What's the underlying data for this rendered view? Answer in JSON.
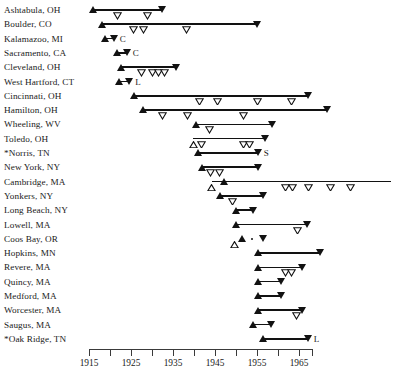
{
  "chart_data": {
    "type": "line",
    "title": "",
    "xlabel": "",
    "ylabel": "",
    "xlim": [
      1915,
      1968
    ],
    "xticks": [
      1915,
      1920,
      1925,
      1930,
      1935,
      1940,
      1945,
      1950,
      1955,
      1960,
      1965
    ],
    "xtick_labels": [
      "1915",
      "",
      "1925",
      "",
      "1935",
      "",
      "1945",
      "",
      "1955",
      "",
      "1965"
    ],
    "grid": false,
    "legend": "none",
    "marker_key": {
      "filled-up-triangle": "start event",
      "open-down-triangle": "intermediate event",
      "filled-down-triangle": "end event",
      "open-up-triangle": "early open start event",
      "dot": "point event"
    },
    "categories": [
      "Ashtabula, OH",
      "Boulder, CO",
      "Kalamazoo, MI",
      "Sacramento, CA",
      "Cleveland, OH",
      "West Hartford, CT",
      "Cincinnati, OH",
      "Hamilton, OH",
      "Wheeling, WV",
      "Toledo, OH",
      "*Norris, TN",
      "New York, NY",
      "Cambridge, MA",
      "Yonkers, NY",
      "Long Beach, NY",
      "Lowell, MA",
      "Coos Bay, OR",
      "Hopkins, MN",
      "Revere, MA",
      "Quincy, MA",
      "Medford, MA",
      "Worcester, MA",
      "Saugus, MA",
      "*Oak Ridge, TN"
    ],
    "rows": [
      {
        "label": "Ashtabula, OH",
        "note": "",
        "line": [
          1916.0,
          1932.5
        ],
        "markers": [
          {
            "x": 1916.0,
            "type": "filled-up-triangle"
          },
          {
            "x": 1921.9,
            "type": "open-down-triangle"
          },
          {
            "x": 1929.0,
            "type": "open-down-triangle"
          },
          {
            "x": 1932.5,
            "type": "filled-down-triangle"
          }
        ]
      },
      {
        "label": "Boulder, CO",
        "note": "",
        "line": [
          1918.2,
          1955.0
        ],
        "markers": [
          {
            "x": 1918.2,
            "type": "filled-up-triangle"
          },
          {
            "x": 1925.5,
            "type": "open-down-triangle"
          },
          {
            "x": 1927.9,
            "type": "open-down-triangle"
          },
          {
            "x": 1938.1,
            "type": "open-down-triangle"
          },
          {
            "x": 1955.0,
            "type": "filled-down-triangle"
          }
        ]
      },
      {
        "label": "Kalamazoo, MI",
        "note": "C",
        "line": [
          1918.8,
          1920.9
        ],
        "markers": [
          {
            "x": 1918.8,
            "type": "filled-up-triangle"
          },
          {
            "x": 1920.9,
            "type": "filled-down-triangle"
          }
        ]
      },
      {
        "label": "Sacramento, CA",
        "note": "C",
        "line": [
          1921.6,
          1924.0
        ],
        "markers": [
          {
            "x": 1921.6,
            "type": "filled-up-triangle"
          },
          {
            "x": 1922.8,
            "type": "dot"
          },
          {
            "x": 1924.0,
            "type": "filled-down-triangle"
          }
        ]
      },
      {
        "label": "Cleveland, OH",
        "note": "",
        "line": [
          1925.0,
          1935.8
        ],
        "markers": [
          {
            "x": 1922.6,
            "type": "filled-up-triangle"
          },
          {
            "x": 1927.4,
            "type": "open-down-triangle"
          },
          {
            "x": 1930.1,
            "type": "open-down-triangle"
          },
          {
            "x": 1931.6,
            "type": "open-down-triangle"
          },
          {
            "x": 1933.0,
            "type": "open-down-triangle"
          },
          {
            "x": 1935.8,
            "type": "filled-down-triangle"
          }
        ]
      },
      {
        "label": "West Hartford, CT",
        "note": "L",
        "line": [
          1922.2,
          1924.6
        ],
        "markers": [
          {
            "x": 1922.2,
            "type": "filled-up-triangle"
          },
          {
            "x": 1924.6,
            "type": "filled-down-triangle"
          }
        ]
      },
      {
        "label": "Cincinnati, OH",
        "note": "",
        "line": [
          1925.7,
          1967.1
        ],
        "markers": [
          {
            "x": 1925.7,
            "type": "filled-up-triangle"
          },
          {
            "x": 1941.4,
            "type": "open-down-triangle"
          },
          {
            "x": 1945.5,
            "type": "open-down-triangle"
          },
          {
            "x": 1955.2,
            "type": "open-down-triangle"
          },
          {
            "x": 1963.3,
            "type": "open-down-triangle"
          },
          {
            "x": 1967.1,
            "type": "filled-down-triangle"
          }
        ]
      },
      {
        "label": "Hamilton, OH",
        "note": "",
        "line": [
          1927.9,
          1971.7
        ],
        "markers": [
          {
            "x": 1927.9,
            "type": "filled-up-triangle"
          },
          {
            "x": 1932.6,
            "type": "open-down-triangle"
          },
          {
            "x": 1938.4,
            "type": "open-down-triangle"
          },
          {
            "x": 1951.7,
            "type": "open-down-triangle"
          },
          {
            "x": 1971.7,
            "type": "filled-down-triangle"
          }
        ]
      },
      {
        "label": "Wheeling, WV",
        "note": "",
        "line": [
          1940.5,
          1958.6
        ],
        "markers": [
          {
            "x": 1940.5,
            "type": "filled-up-triangle"
          },
          {
            "x": 1943.6,
            "type": "open-down-triangle"
          },
          {
            "x": 1958.6,
            "type": "filled-down-triangle"
          }
        ]
      },
      {
        "label": "Toledo, OH",
        "note": "",
        "line": [
          1939.8,
          1956.9
        ],
        "markers": [
          {
            "x": 1939.8,
            "type": "open-up-triangle"
          },
          {
            "x": 1941.9,
            "type": "open-down-triangle"
          },
          {
            "x": 1951.9,
            "type": "open-down-triangle"
          },
          {
            "x": 1953.3,
            "type": "open-down-triangle"
          },
          {
            "x": 1956.9,
            "type": "filled-down-triangle"
          }
        ]
      },
      {
        "label": "*Norris, TN",
        "note": "S",
        "line": [
          1041.0,
          1955.2
        ],
        "markers": [
          {
            "x": 1940.9,
            "type": "filled-up-triangle"
          },
          {
            "x": 1955.2,
            "type": "filled-down-triangle"
          }
        ]
      },
      {
        "label": "New York, NY",
        "note": "",
        "line": [
          1942.0,
          1955.2
        ],
        "markers": [
          {
            "x": 1942.0,
            "type": "filled-up-triangle"
          },
          {
            "x": 1943.9,
            "type": "open-down-triangle"
          },
          {
            "x": 1946.1,
            "type": "open-down-triangle"
          },
          {
            "x": 1955.2,
            "type": "filled-down-triangle"
          }
        ]
      },
      {
        "label": "Cambridge, MA",
        "note": "",
        "line": [
          1947.1,
          1986.9
        ],
        "markers": [
          {
            "x": 1944.2,
            "type": "open-up-triangle"
          },
          {
            "x": 1947.1,
            "type": "filled-up-triangle"
          },
          {
            "x": 1961.8,
            "type": "open-down-triangle"
          },
          {
            "x": 1963.5,
            "type": "open-down-triangle"
          },
          {
            "x": 1967.3,
            "type": "open-down-triangle"
          },
          {
            "x": 1972.5,
            "type": "open-down-triangle"
          },
          {
            "x": 1977.3,
            "type": "open-down-triangle"
          }
        ]
      },
      {
        "label": "Yonkers, NY",
        "note": "",
        "line": [
          1946.3,
          1956.5
        ],
        "markers": [
          {
            "x": 1946.3,
            "type": "filled-up-triangle"
          },
          {
            "x": 1949.1,
            "type": "open-down-triangle"
          },
          {
            "x": 1956.5,
            "type": "filled-down-triangle"
          }
        ]
      },
      {
        "label": "Long Beach, NY",
        "note": "",
        "line": [
          1950.0,
          1954.0
        ],
        "markers": [
          {
            "x": 1950.0,
            "type": "filled-up-triangle"
          },
          {
            "x": 1954.0,
            "type": "filled-down-triangle"
          }
        ]
      },
      {
        "label": "Lowell, MA",
        "note": "",
        "line": [
          1950.0,
          1967.0
        ],
        "markers": [
          {
            "x": 1950.0,
            "type": "filled-up-triangle"
          },
          {
            "x": 1964.6,
            "type": "open-down-triangle"
          },
          {
            "x": 1967.0,
            "type": "filled-down-triangle"
          }
        ]
      },
      {
        "label": "Coos Bay, OR",
        "note": "",
        "line": [
          0,
          0
        ],
        "markers": [
          {
            "x": 1949.6,
            "type": "open-up-triangle"
          },
          {
            "x": 1951.5,
            "type": "filled-up-triangle"
          },
          {
            "x": 1953.8,
            "type": "dot"
          },
          {
            "x": 1956.5,
            "type": "filled-down-triangle"
          }
        ]
      },
      {
        "label": "Hopkins, MN",
        "note": "",
        "line": [
          1955.2,
          1970.0
        ],
        "markers": [
          {
            "x": 1955.2,
            "type": "filled-up-triangle"
          },
          {
            "x": 1970.0,
            "type": "filled-down-triangle"
          }
        ]
      },
      {
        "label": "Revere, MA",
        "note": "",
        "line": [
          1957.0,
          1965.8
        ],
        "markers": [
          {
            "x": 1955.2,
            "type": "filled-up-triangle"
          },
          {
            "x": 1961.8,
            "type": "open-down-triangle"
          },
          {
            "x": 1963.3,
            "type": "open-down-triangle"
          },
          {
            "x": 1965.8,
            "type": "filled-down-triangle"
          }
        ]
      },
      {
        "label": "Quincy, MA",
        "note": "",
        "line": [
          1957.0,
          1960.8
        ],
        "markers": [
          {
            "x": 1955.2,
            "type": "filled-up-triangle"
          },
          {
            "x": 1960.8,
            "type": "filled-down-triangle"
          }
        ]
      },
      {
        "label": "Medford, MA",
        "note": "",
        "line": [
          1957.0,
          1960.8
        ],
        "markers": [
          {
            "x": 1955.2,
            "type": "filled-up-triangle"
          },
          {
            "x": 1960.8,
            "type": "filled-down-triangle"
          }
        ]
      },
      {
        "label": "Worcester, MA",
        "note": "",
        "line": [
          1956.5,
          1964.6
        ],
        "markers": [
          {
            "x": 1955.2,
            "type": "filled-up-triangle"
          },
          {
            "x": 1964.3,
            "type": "open-down-triangle"
          },
          {
            "x": 1965.8,
            "type": "filled-down-triangle"
          }
        ]
      },
      {
        "label": "Saugus, MA",
        "note": "",
        "line": [
          1954.0,
          1958.4
        ],
        "markers": [
          {
            "x": 1954.0,
            "type": "filled-up-triangle"
          },
          {
            "x": 1958.4,
            "type": "filled-down-triangle"
          }
        ]
      },
      {
        "label": "*Oak Ridge, TN",
        "note": "L",
        "line": [
          1956.5,
          1966.5
        ],
        "markers": [
          {
            "x": 1956.5,
            "type": "filled-up-triangle"
          },
          {
            "x": 1967.1,
            "type": "filled-down-triangle"
          }
        ]
      }
    ]
  },
  "axis": {
    "start_year": 1915,
    "end_year": 1968,
    "minor_step": 2.5,
    "label_step": 10
  }
}
